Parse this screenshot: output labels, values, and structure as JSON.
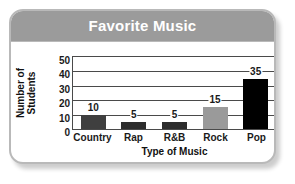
{
  "chart_data": {
    "type": "bar",
    "title": "Favorite Music",
    "xlabel": "Type of Music",
    "ylabel_line1": "Number of",
    "ylabel_line2": "Students",
    "categories": [
      "Country",
      "Rap",
      "R&B",
      "Rock",
      "Pop"
    ],
    "values": [
      10,
      5,
      5,
      15,
      35
    ],
    "value_labels": [
      "10",
      "5",
      "5",
      "15",
      "35"
    ],
    "bar_colors": [
      "#3f3f3f",
      "#2d2d2d",
      "#2d2d2d",
      "#9a9a9a",
      "#000000"
    ],
    "ylim": [
      0,
      50
    ],
    "yticks": [
      50,
      40,
      30,
      20,
      10,
      0
    ],
    "ytick_labels": [
      "50",
      "40",
      "30",
      "20",
      "10",
      "0"
    ],
    "grid": true,
    "legend": "none"
  },
  "card": {
    "title_band_color": "#9b9b9b",
    "border_color": "#b9b9b9",
    "title_text_color": "#ffffff"
  }
}
